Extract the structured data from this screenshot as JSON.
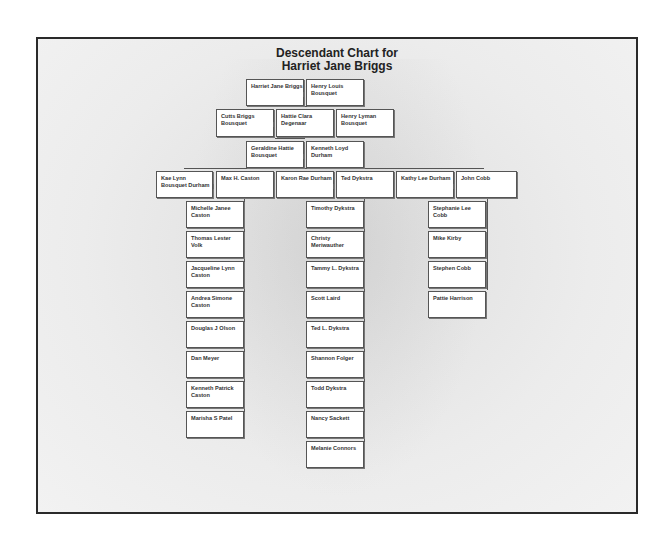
{
  "title": {
    "line1": "Descendant Chart for",
    "line2": "Harriet Jane Briggs"
  },
  "gen1": [
    {
      "name": "Harriet Jane Briggs"
    },
    {
      "name": "Henry Louis Bousquet"
    }
  ],
  "gen2": [
    {
      "name": "Cutts Briggs Bousquet"
    },
    {
      "name": "Hattie Clara Degenaar"
    },
    {
      "name": "Henry Lyman Bousquet"
    }
  ],
  "gen3": [
    {
      "name": "Geraldine Hattie Bousquet"
    },
    {
      "name": "Kenneth Loyd Durham"
    }
  ],
  "gen4": [
    {
      "name": "Kae Lynn Bousquet Durham"
    },
    {
      "name": "Max H. Caston"
    },
    {
      "name": "Karon Rae Durham"
    },
    {
      "name": "Ted Dykstra"
    },
    {
      "name": "Kathy Lee Durham"
    },
    {
      "name": "John Cobb"
    }
  ],
  "caston_children": [
    {
      "name": "Michelle Janee Caston"
    },
    {
      "name": "Thomas Lester Volk"
    },
    {
      "name": "Jacqueline Lynn Caston"
    },
    {
      "name": "Andrea Simone Caston"
    },
    {
      "name": "Douglas J Olson"
    },
    {
      "name": "Dan Meyer"
    },
    {
      "name": "Kenneth Patrick Caston"
    },
    {
      "name": "Marisha S Patel"
    }
  ],
  "dykstra_children": [
    {
      "name": "Timothy Dykstra"
    },
    {
      "name": "Christy Meriwauther"
    },
    {
      "name": "Tammy L. Dykstra"
    },
    {
      "name": "Scott Laird"
    },
    {
      "name": "Ted L. Dykstra"
    },
    {
      "name": "Shannon Folger"
    },
    {
      "name": "Todd Dykstra"
    },
    {
      "name": "Nancy Sackett"
    },
    {
      "name": "Melanie Connors"
    }
  ],
  "cobb_children": [
    {
      "name": "Stephanie Lee Cobb"
    },
    {
      "name": "Mike Kirby"
    },
    {
      "name": "Stephen Cobb"
    },
    {
      "name": "Pattie Harrison"
    }
  ]
}
